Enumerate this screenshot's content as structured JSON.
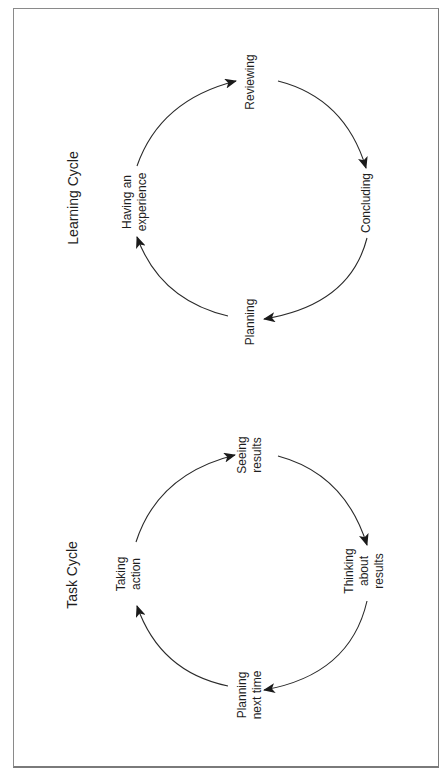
{
  "learning_cycle": {
    "title": "Learning Cycle",
    "stages": [
      {
        "label": "Reviewing",
        "lines": [
          "Reviewing"
        ]
      },
      {
        "label": "Concluding",
        "lines": [
          "Concluding"
        ]
      },
      {
        "label": "Planning",
        "lines": [
          "Planning"
        ]
      },
      {
        "label": "Having an experience",
        "lines": [
          "Having an",
          "experience"
        ]
      }
    ],
    "flow": "clockwise: Having an experience → Reviewing → Concluding → Planning → Having an experience"
  },
  "task_cycle": {
    "title": "Task Cycle",
    "stages": [
      {
        "label": "Seeing results",
        "lines": [
          "Seeing",
          "results"
        ]
      },
      {
        "label": "Thinking about results",
        "lines": [
          "Thinking",
          "about",
          "results"
        ]
      },
      {
        "label": "Planning next time",
        "lines": [
          "Planning",
          "next time"
        ]
      },
      {
        "label": "Taking action",
        "lines": [
          "Taking",
          "action"
        ]
      }
    ],
    "flow": "clockwise: Taking action → Seeing results → Thinking about results → Planning next time → Taking action"
  },
  "colors": {
    "line": "#2a2a2a",
    "frame": "#8a8a8a",
    "background": "#ffffff"
  }
}
